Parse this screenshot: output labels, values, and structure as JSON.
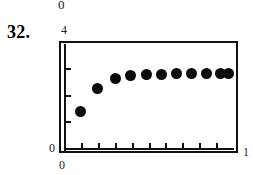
{
  "figure": {
    "problem_number": "32.",
    "stray_label_above": "0"
  },
  "axes": {
    "y_min_label": "0",
    "y_max_label": "4",
    "x_min_label": "0",
    "x_max_label": "1"
  },
  "chart_data": {
    "type": "scatter",
    "title": "",
    "xlabel": "",
    "ylabel": "",
    "xlim": [
      0,
      1
    ],
    "ylim": [
      0,
      4
    ],
    "xticks": [
      0,
      0.1,
      0.2,
      0.3,
      0.4,
      0.5,
      0.6,
      0.7,
      0.8,
      0.9,
      1
    ],
    "yticks": [
      0,
      1,
      2,
      3,
      4
    ],
    "xtick_labels": [
      "0",
      "",
      "",
      "",
      "",
      "",
      "",
      "",
      "",
      "",
      "1"
    ],
    "ytick_labels": [
      "0",
      "",
      "",
      "",
      "4"
    ],
    "grid": false,
    "legend": false,
    "marker": "filled-circle",
    "marker_color": "#0a0a0a",
    "x": [
      0.09,
      0.19,
      0.3,
      0.39,
      0.48,
      0.57,
      0.66,
      0.75,
      0.84,
      0.92,
      0.97
    ],
    "y": [
      1.4,
      2.28,
      2.62,
      2.73,
      2.8,
      2.8,
      2.83,
      2.83,
      2.83,
      2.83,
      2.83
    ],
    "series": [
      {
        "name": "sequence",
        "values": [
          1.4,
          2.28,
          2.62,
          2.73,
          2.8,
          2.8,
          2.83,
          2.83,
          2.83,
          2.83,
          2.83
        ]
      }
    ]
  }
}
